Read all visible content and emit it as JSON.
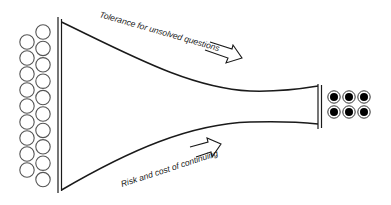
{
  "diagram": {
    "labels": {
      "top": "Tolerance for unsolved questions",
      "bottom": "Risk and cost of continuing"
    },
    "inputs": {
      "left_column_count": 9,
      "right_column_count": 10,
      "style": "hollow-circle"
    },
    "outputs": {
      "rows": 2,
      "cols": 3,
      "style": "filled-circle-with-ring"
    },
    "colors": {
      "stroke": "#1a1a1a",
      "circle_stroke": "#555555",
      "fill": "#000000",
      "background": "#ffffff"
    }
  }
}
